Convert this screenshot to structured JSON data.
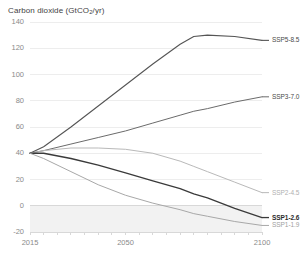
{
  "chart_data": {
    "type": "line",
    "title": "Carbon dioxide (GtCO2/yr)",
    "title_main": "Carbon dioxide (GtCO",
    "title_sub": "2",
    "title_tail": "/yr)",
    "xlabel": "",
    "ylabel": "",
    "xlim": [
      2015,
      2100
    ],
    "ylim": [
      -20,
      140
    ],
    "grid": true,
    "legend_position": "right-inline",
    "x_ticks": [
      2015,
      2050,
      2100
    ],
    "x_tick_labels": [
      "2015",
      "2050",
      "2100"
    ],
    "y_ticks": [
      -20,
      0,
      20,
      40,
      60,
      80,
      100,
      120,
      140
    ],
    "y_tick_labels": [
      "-20",
      "0",
      "20",
      "40",
      "60",
      "80",
      "100",
      "120",
      "140"
    ],
    "negative_band": {
      "from": -20,
      "to": 0,
      "color": "#f2f2f2"
    },
    "x": [
      2015,
      2020,
      2030,
      2040,
      2050,
      2060,
      2070,
      2075,
      2080,
      2090,
      2100
    ],
    "series": [
      {
        "name": "SSP5-8.5",
        "label": "SSP5-8.5",
        "color": "#555555",
        "width": 1.1,
        "bold_label": false,
        "label_color": "#4a4a4a",
        "values": [
          40,
          45,
          60,
          76,
          92,
          108,
          123,
          129,
          130,
          129,
          126
        ],
        "end_value": 126
      },
      {
        "name": "SSP3-7.0",
        "label": "SSP3-7.0",
        "color": "#6b6b6b",
        "width": 1.0,
        "bold_label": false,
        "label_color": "#4a4a4a",
        "values": [
          40,
          42,
          47,
          52,
          57,
          63,
          69,
          72,
          74,
          79,
          83
        ],
        "end_value": 83
      },
      {
        "name": "SSP2-4.5",
        "label": "SSP2-4.5",
        "color": "#b9b9b9",
        "width": 1.0,
        "bold_label": false,
        "label_color": "#b0b0b0",
        "values": [
          40,
          42,
          44,
          44,
          43,
          40,
          34,
          30,
          26,
          18,
          10
        ],
        "end_value": 10
      },
      {
        "name": "SSP1-2.6",
        "label": "SSP1-2.6",
        "color": "#3a3a3a",
        "width": 1.3,
        "bold_label": true,
        "label_color": "#2b2b2b",
        "values": [
          40,
          40,
          36,
          31,
          25,
          19,
          13,
          9,
          6,
          -2,
          -9
        ],
        "end_value": -9
      },
      {
        "name": "SSP1-1.9",
        "label": "SSP1-1.9",
        "color": "#a8a8a8",
        "width": 1.0,
        "bold_label": false,
        "label_color": "#a0a0a0",
        "values": [
          40,
          36,
          26,
          16,
          8,
          2,
          -3,
          -6,
          -8,
          -12,
          -15
        ],
        "end_value": -15
      }
    ]
  }
}
